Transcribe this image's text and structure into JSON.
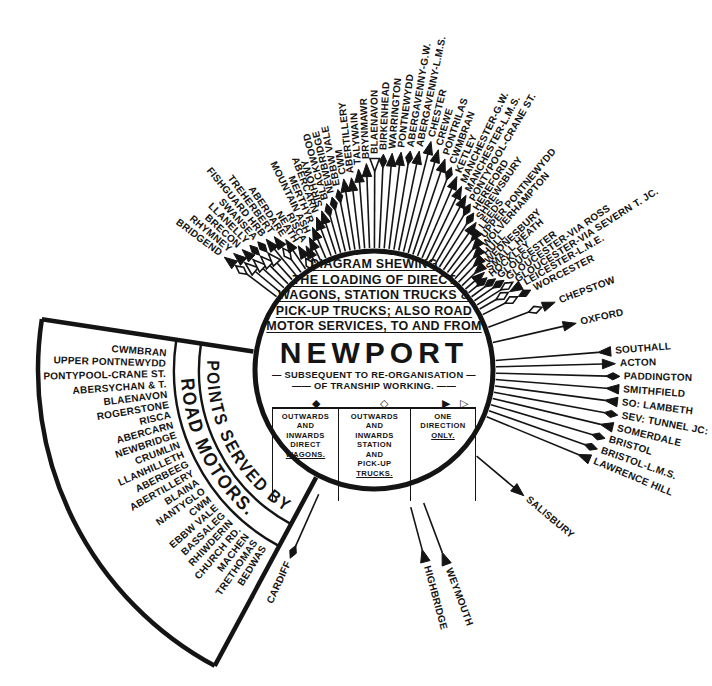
{
  "colors": {
    "ink": "#141414",
    "paper": "#ffffff"
  },
  "center": {
    "title_lines": [
      "DIAGRAM SHEWING",
      "THE LOADING OF DIRECT",
      "WAGONS, STATION TRUCKS &",
      "PICK-UP TRUCKS; ALSO ROAD",
      "MOTOR SERVICES, TO AND FROM"
    ],
    "city": "NEWPORT",
    "subtitle_line1": "— SUBSEQUENT TO RE-ORGANISATION —",
    "subtitle_line2": "—— OF TRANSHIP WORKING. ——"
  },
  "legend": {
    "columns": [
      {
        "symbols": [
          "filled-diamond"
        ],
        "glyphs": [
          "◆"
        ],
        "lines": [
          "OUTWARDS",
          "AND",
          "INWARDS",
          "DIRECT",
          "WAGONS."
        ]
      },
      {
        "symbols": [
          "open-diamond"
        ],
        "glyphs": [
          "◇"
        ],
        "lines": [
          "OUTWARDS",
          "AND",
          "INWARDS",
          "STATION",
          "AND",
          "PICK-UP",
          "TRUCKS."
        ]
      },
      {
        "symbols": [
          "filled-arrow",
          "open-arrow"
        ],
        "glyphs": [
          "▶",
          "▷"
        ],
        "lines": [
          "ONE",
          "DIRECTION",
          "ONLY."
        ]
      }
    ]
  },
  "fan": {
    "band1_label": "POINTS SERVED BY",
    "band2_label": "ROAD MOTORS.",
    "places": [
      "CWMBRAN",
      "UPPER PONTNEWYDD",
      "PONTYPOOL-CRANE ST.",
      "ABERSYCHAN & T.",
      "BLAENAVON",
      "ROGERSTONE",
      "RISCA",
      "ABERCARN",
      "NEWBRIDGE",
      "CRUMLIN",
      "LLANHILLETH",
      "ABERBEEG",
      "ABERTILLERY",
      "BLAINA",
      "NANTYGLO",
      "CWM",
      "EBBW VALE",
      "BASSALEG",
      "RHIWDERIN",
      "CHURCH RD.",
      "MACHEN",
      "TRETHOMAS",
      "BEDWAS"
    ]
  },
  "spokes": [
    {
      "n": "BRIDGEND",
      "a": 143,
      "r": 192,
      "s": [
        "fao",
        "od"
      ]
    },
    {
      "n": "RHYMNEY",
      "a": 140.3,
      "r": 187,
      "s": [
        "fao",
        "oao"
      ]
    },
    {
      "n": "BRECON",
      "a": 137.6,
      "r": 183,
      "s": [
        "fao",
        "oao"
      ]
    },
    {
      "n": "LLANELLY",
      "a": 134.9,
      "r": 180,
      "s": [
        "fd",
        "oao"
      ]
    },
    {
      "n": "SWANSEA",
      "a": 132.2,
      "r": 177,
      "s": [
        "fd",
        "oao"
      ]
    },
    {
      "n": "FISHGUARD HRB",
      "a": 129.5,
      "r": 174,
      "s": [
        "fao"
      ]
    },
    {
      "n": "TREHERBERT",
      "a": 126.8,
      "r": 171,
      "s": [
        "fao",
        "od"
      ]
    },
    {
      "n": "ABERDARE",
      "a": 124.1,
      "r": 162,
      "s": [
        "fao"
      ]
    },
    {
      "n": "NEATH",
      "a": 121.4,
      "r": 150,
      "s": [
        "fao",
        "od"
      ]
    },
    {
      "n": "RISCA",
      "a": 118.7,
      "r": 146,
      "s": [
        "fao"
      ]
    },
    {
      "n": "MOUNTAIN ASH",
      "a": 116,
      "r": 152,
      "s": [
        "fao"
      ]
    },
    {
      "n": "MERTHYR",
      "a": 113.3,
      "r": 160,
      "s": [
        "fao"
      ]
    },
    {
      "n": "ABERCARN",
      "a": 110.6,
      "r": 168,
      "s": [
        "fao"
      ]
    },
    {
      "n": "SIRHOWY",
      "a": 108.2,
      "r": 172,
      "s": [
        "fao"
      ]
    },
    {
      "n": "BLACKWOOD",
      "a": 105.9,
      "r": 177,
      "s": [
        "fd"
      ]
    },
    {
      "n": "NEWBRIDGE",
      "a": 103.6,
      "r": 182,
      "s": [
        "fd"
      ]
    },
    {
      "n": "EBBW VALE",
      "a": 101.3,
      "r": 188,
      "s": [
        "fd"
      ]
    },
    {
      "n": "CWM",
      "a": 99,
      "r": 198,
      "s": [
        "fao"
      ]
    },
    {
      "n": "ABERTILLERY",
      "a": 96.7,
      "r": 198,
      "s": [
        "fao"
      ]
    },
    {
      "n": "TALYWAIN",
      "a": 94.4,
      "r": 206,
      "s": [
        "fao"
      ]
    },
    {
      "n": "BRYNMAWR",
      "a": 92.1,
      "r": 211,
      "s": [
        "fao"
      ]
    },
    {
      "n": "BLAENAVON",
      "a": 89.8,
      "r": 216,
      "s": [
        "oai"
      ]
    },
    {
      "n": "BIRKENHEAD",
      "a": 87.5,
      "r": 220,
      "s": [
        "fd"
      ]
    },
    {
      "n": "WARRINGTON",
      "a": 85.2,
      "r": 222,
      "s": [
        "fao"
      ]
    },
    {
      "n": "PONTNEWYDD",
      "a": 82.9,
      "r": 224,
      "s": [
        "fao"
      ]
    },
    {
      "n": "ABERGAVENNY-G.W.",
      "a": 80.6,
      "r": 226,
      "s": [
        "fd"
      ]
    },
    {
      "n": "ABERGAVENNY-L.M.S.",
      "a": 78.3,
      "r": 228,
      "s": [
        "fao"
      ]
    },
    {
      "n": "CHESTER",
      "a": 76,
      "r": 240,
      "s": [
        "fao"
      ]
    },
    {
      "n": "CREWE",
      "a": 73.7,
      "r": 234,
      "s": [
        "fao"
      ]
    },
    {
      "n": "PONTRILAS",
      "a": 71.4,
      "r": 227,
      "s": [
        "fao"
      ]
    },
    {
      "n": "CWMBRAN",
      "a": 69.1,
      "r": 221,
      "s": [
        "fd"
      ]
    },
    {
      "n": "KETLEY",
      "a": 66.8,
      "r": 215,
      "s": [
        "fao"
      ]
    },
    {
      "n": "MANCHESTER-G.W.",
      "a": 64.5,
      "r": 208,
      "s": [
        "fao"
      ]
    },
    {
      "n": "MANCHESTER-L.M.S.",
      "a": 62.2,
      "r": 202,
      "s": [
        "fao"
      ]
    },
    {
      "n": "PONTYPOOL-CRANE ST.",
      "a": 59.9,
      "r": 196,
      "s": [
        "fd"
      ]
    },
    {
      "n": "HEREFORD",
      "a": 57.6,
      "r": 190,
      "s": [
        "fd"
      ]
    },
    {
      "n": "SHREWSBURY",
      "a": 55.3,
      "r": 184,
      "s": [
        "fao"
      ]
    },
    {
      "n": "LEEDS",
      "a": 53,
      "r": 178,
      "s": [
        "fai"
      ]
    },
    {
      "n": "UPPER PONTNEWYDD",
      "a": 50.7,
      "r": 172,
      "s": [
        "fai"
      ]
    },
    {
      "n": "WOLVERHAMPTON",
      "a": 48.4,
      "r": 166,
      "s": [
        "fai"
      ]
    },
    {
      "n": "HULL",
      "a": 46.1,
      "r": 160,
      "s": [
        "fai"
      ]
    },
    {
      "n": "WEDNESBURY",
      "a": 43.8,
      "r": 156,
      "s": [
        "fai"
      ]
    },
    {
      "n": "SMALL HEATH",
      "a": 41.5,
      "r": 152,
      "s": [
        "fao"
      ]
    },
    {
      "n": "HOCKLEY",
      "a": 39.2,
      "r": 150,
      "s": [
        "fd"
      ]
    },
    {
      "n": "GLOUCESTER",
      "a": 36.9,
      "r": 156,
      "s": [
        "fd"
      ]
    },
    {
      "n": "GLOUCESTER-VIA ROSS",
      "a": 34.6,
      "r": 162,
      "s": [
        "fd"
      ]
    },
    {
      "n": "GLOUCESTER-VIA SEVERN T. JC.",
      "a": 32.3,
      "r": 168,
      "s": [
        "od"
      ]
    },
    {
      "n": "LEICESTER-L.N.E.",
      "a": 30,
      "r": 174,
      "s": [
        "fai",
        "od"
      ]
    },
    {
      "n": "WORCESTER",
      "a": 27,
      "r": 180,
      "s": [
        "fd",
        "od"
      ]
    },
    {
      "n": "CHEPSTOW",
      "a": 20.5,
      "r": 198,
      "s": [
        "fao",
        "od"
      ]
    },
    {
      "n": "OXFORD",
      "a": 13,
      "r": 212,
      "s": [
        "fao"
      ]
    },
    {
      "n": "SOUTHALL",
      "a": 4.5,
      "r": 242,
      "s": [
        "fai"
      ]
    },
    {
      "n": "ACTON",
      "a": 1.5,
      "r": 246,
      "s": [
        "fao"
      ]
    },
    {
      "n": "PADDINGTON",
      "a": -1.5,
      "r": 250,
      "s": [
        "fd"
      ]
    },
    {
      "n": "SMITHFIELD",
      "a": -4.5,
      "r": 250,
      "s": [
        "fai"
      ]
    },
    {
      "n": "SO: LAMBETH",
      "a": -7.5,
      "r": 250,
      "s": [
        "fai"
      ]
    },
    {
      "n": "SEV: TUNNEL JC:",
      "a": -10.5,
      "r": 252,
      "s": [
        "fd"
      ]
    },
    {
      "n": "SOMERDALE",
      "a": -13.5,
      "r": 250,
      "s": [
        "fai"
      ]
    },
    {
      "n": "BRISTOL",
      "a": -16.5,
      "r": 245,
      "s": [
        "fd"
      ]
    },
    {
      "n": "BRISTOL-L.M.S.",
      "a": -19.5,
      "r": 241,
      "s": [
        "fd"
      ]
    },
    {
      "n": "LAWRENCE HILL",
      "a": -22.5,
      "r": 238,
      "s": [
        "fai"
      ]
    },
    {
      "n": "SALISBURY",
      "a": -40,
      "r": 200,
      "s": [
        "fao"
      ],
      "start": 134
    },
    {
      "n": "WEYMOUTH",
      "a": -69.5,
      "r": 212,
      "s": [
        "fai"
      ],
      "start": 142
    },
    {
      "n": "HIGHBRIDGE",
      "a": -75,
      "r": 203,
      "s": [
        "fai"
      ],
      "start": 142
    },
    {
      "n": "CARDIFF",
      "a": -114,
      "r": 210,
      "s": [
        "fd"
      ],
      "start": 136
    }
  ]
}
